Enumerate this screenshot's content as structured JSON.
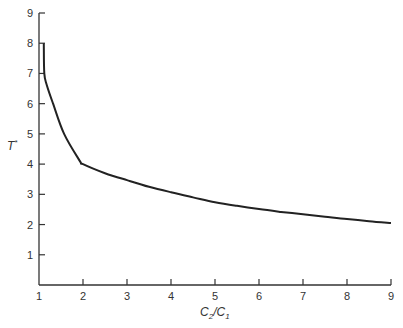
{
  "chart_data": {
    "type": "line",
    "title": "",
    "xlabel": "C2/C1",
    "xlabel_parts": {
      "main1": "C",
      "sub1": "2",
      "slash": "/",
      "main2": "C",
      "sub2": "1"
    },
    "ylabel": "T*",
    "ylabel_parts": {
      "main": "T",
      "sup": "*"
    },
    "xlim": [
      1,
      9
    ],
    "ylim": [
      0,
      9
    ],
    "x_ticks": [
      1,
      2,
      3,
      4,
      5,
      6,
      7,
      8,
      9
    ],
    "y_ticks": [
      1,
      2,
      3,
      4,
      5,
      6,
      7,
      8,
      9
    ],
    "grid": false,
    "legend": null,
    "series": [
      {
        "name": "T*",
        "color": "#222222",
        "x": [
          1.11,
          1.12,
          1.18,
          1.32,
          1.57,
          1.93,
          2.0,
          2.5,
          3.0,
          3.5,
          4.0,
          4.5,
          5.0,
          5.5,
          6.0,
          6.5,
          7.0,
          7.5,
          8.0,
          8.5,
          9.0
        ],
        "y": [
          8.0,
          7.0,
          6.6,
          6.0,
          5.0,
          4.1,
          4.0,
          3.7,
          3.47,
          3.25,
          3.07,
          2.9,
          2.74,
          2.62,
          2.51,
          2.42,
          2.34,
          2.26,
          2.18,
          2.11,
          2.05
        ]
      }
    ]
  }
}
